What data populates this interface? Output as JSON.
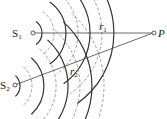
{
  "diagram": {
    "sources": [
      {
        "id": "S1",
        "label": "S",
        "subscript": "1"
      },
      {
        "id": "S2",
        "label": "S",
        "subscript": "2"
      }
    ],
    "point": {
      "id": "P",
      "label": "P"
    },
    "paths": [
      {
        "from": "S1",
        "to": "P",
        "label": "r",
        "subscript": "1"
      },
      {
        "from": "S2",
        "to": "P",
        "label": "r",
        "subscript": "2"
      }
    ],
    "wavefronts": {
      "style": "alternating solid (crest) and dashed (trough) arcs",
      "colors": {
        "crest": "#333333",
        "trough": "#888888",
        "line": "#444444"
      }
    }
  }
}
